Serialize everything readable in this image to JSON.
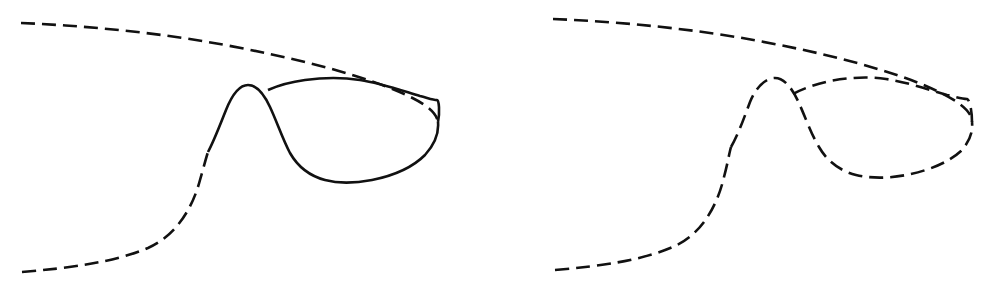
{
  "figure": {
    "background_color": "#ffffff",
    "stroke_color": "#111111",
    "stroke_width": 2.6,
    "dash_pattern": "14 7",
    "canvas": {
      "width": 988,
      "height": 292
    },
    "panel_count": 2,
    "panels": [
      {
        "id": "panel-left",
        "caption": "",
        "origin_x": 0,
        "width": 494,
        "height": 292,
        "description": "S-shaped hysteresis curve: dashed outer branches with a solid middle branch through the hump and loop bottom",
        "segments": [
          {
            "id": "upper-dashed-branch",
            "style": "dashed",
            "path": "M 21 23 C 90 26 160 33 225 45 C 290 57 350 72 390 88 C 420 100 436 110 438 122"
          },
          {
            "id": "solid-middle-branch",
            "style": "solid",
            "path": "M 438 122 C 440 112 439 100 437 100 C 433 100 428 98 420 96 C 400 90 380 83 360 80 C 340 77 320 78 305 80 C 290 82 277 86 268 90"
          },
          {
            "id": "solid-hump-and-loop",
            "style": "solid",
            "path": "M 208 152 C 214 141 220 125 226 110 C 232 95 240 85 248 85 C 256 85 264 94 270 107 C 277 122 283 140 290 153 C 298 167 310 176 325 180 C 340 184 356 183 372 180 C 392 176 412 168 425 155 C 435 144 439 133 438 122"
          },
          {
            "id": "lower-dashed-branch",
            "style": "dashed",
            "path": "M 22 272 C 70 268 115 262 148 248 C 175 236 192 210 200 180 C 204 166 206 158 208 152"
          }
        ]
      },
      {
        "id": "panel-right",
        "caption": "",
        "origin_x": 494,
        "width": 494,
        "height": 292,
        "description": "Same S-shaped hysteresis curve but rendered entirely with a dashed stroke, including the middle branch",
        "segments": [
          {
            "id": "upper-dashed-branch",
            "style": "dashed",
            "path": "M 59 19 C 130 22 200 29 265 41 C 330 53 392 69 432 86 C 462 99 478 110 478 122"
          },
          {
            "id": "middle-dashed-branch",
            "style": "dashed",
            "path": "M 478 122 C 478 112 476 100 473 99 C 468 99 462 97 453 95 C 433 89 412 82 392 79 C 372 76 352 78 336 81 C 322 84 308 89 299 94"
          },
          {
            "id": "dashed-hump-and-loop",
            "style": "dashed",
            "path": "M 237 147 C 244 135 250 118 256 102 C 262 87 272 78 281 78 C 290 78 298 88 304 101 C 311 116 317 134 325 147 C 333 161 346 171 362 175 C 379 179 396 178 412 175 C 433 171 454 163 467 151 C 476 141 479 132 478 122"
          },
          {
            "id": "lower-dashed-branch",
            "style": "dashed",
            "path": "M 61 270 C 108 266 150 260 181 246 C 207 234 223 207 230 177 C 234 162 235 154 237 147"
          }
        ]
      }
    ]
  }
}
